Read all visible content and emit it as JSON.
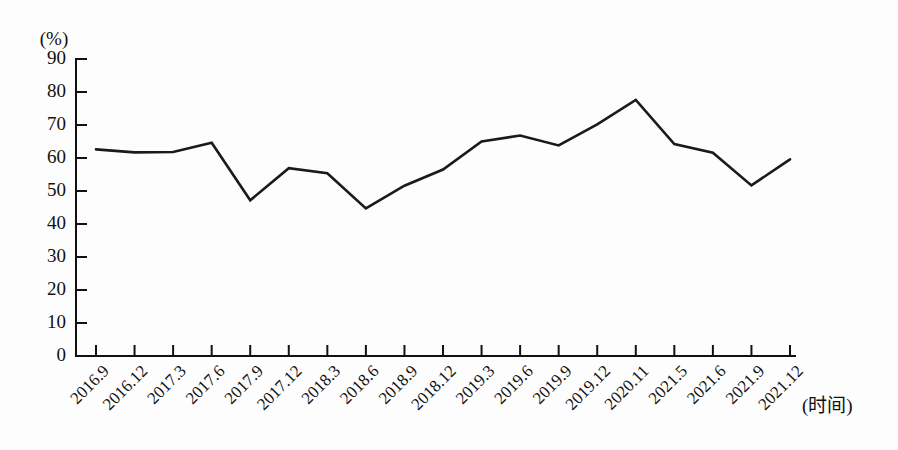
{
  "chart_data": {
    "type": "line",
    "title": "",
    "subtitle": "",
    "xlabel": "(时间)",
    "ylabel": "(%)",
    "unit_label": "(%)",
    "categories": [
      "2016.9",
      "2016.12",
      "2017.3",
      "2017.6",
      "2017.9",
      "2017.12",
      "2018.3",
      "2018.6",
      "2018.9",
      "2018.12",
      "2019.3",
      "2019.6",
      "2019.9",
      "2019.12",
      "2020.11",
      "2021.5",
      "2021.6",
      "2021.9",
      "2021.12"
    ],
    "values": [
      62.6,
      61.7,
      61.8,
      64.6,
      47.2,
      56.9,
      55.4,
      44.7,
      51.6,
      56.5,
      65.0,
      66.8,
      63.8,
      70.2,
      77.6,
      64.2,
      61.6,
      51.7,
      59.6
    ],
    "ylim": [
      0,
      90
    ],
    "ytick_values": [
      0,
      10,
      20,
      30,
      40,
      50,
      60,
      70,
      80,
      90
    ],
    "ytick_labels": [
      "0",
      "10",
      "20",
      "30",
      "40",
      "50",
      "60",
      "70",
      "80",
      "90"
    ],
    "grid": false,
    "legend": null,
    "legend_position": "none",
    "series_color": "#1a1a1a",
    "axis_color": "#111111",
    "background_color": "#fdfdfd"
  }
}
